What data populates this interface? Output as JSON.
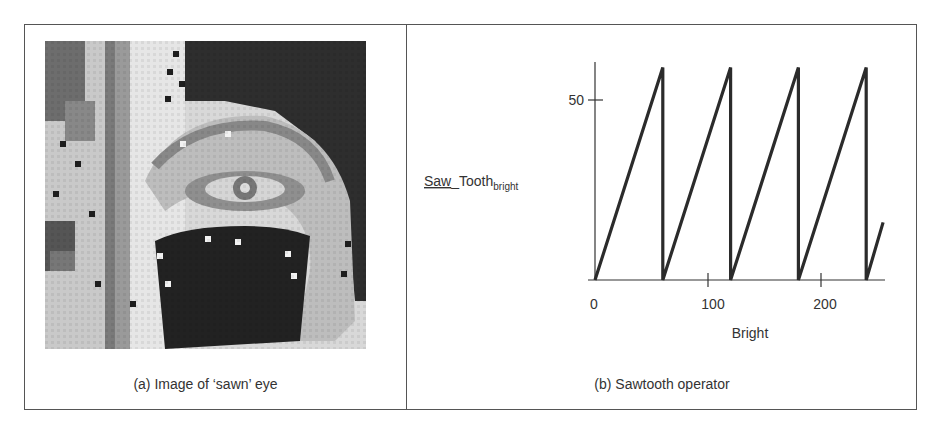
{
  "figure": {
    "panel_a": {
      "caption": "(a) Image of ‘sawn’ eye",
      "image_description": "64x64 pixelated grayscale image of an eye after sawtooth brightness operator"
    },
    "panel_b": {
      "caption": "(b) Sawtooth operator",
      "ylabel_main": "Saw_Tooth",
      "ylabel_underlined_part": "Saw",
      "ylabel_rest": "_Tooth",
      "ylabel_subscript": "bright",
      "xlabel": "Bright",
      "x_ticks": [
        "0",
        "100",
        "200"
      ],
      "y_ticks": [
        "50"
      ]
    }
  },
  "chart_data": {
    "type": "line",
    "title": "(b) Sawtooth operator",
    "xlabel": "Bright",
    "ylabel": "Saw_Tooth_bright",
    "x": [
      0,
      60,
      60,
      120,
      120,
      180,
      180,
      240,
      240,
      255
    ],
    "series": [
      {
        "name": "Saw_Tooth_bright",
        "values": [
          0,
          59,
          0,
          59,
          0,
          59,
          0,
          59,
          0,
          16
        ]
      }
    ],
    "x_ticks": [
      0,
      100,
      200
    ],
    "y_ticks": [
      50
    ],
    "xlim": [
      0,
      256
    ],
    "ylim": [
      0,
      62
    ],
    "grid": false,
    "legend": "none"
  }
}
